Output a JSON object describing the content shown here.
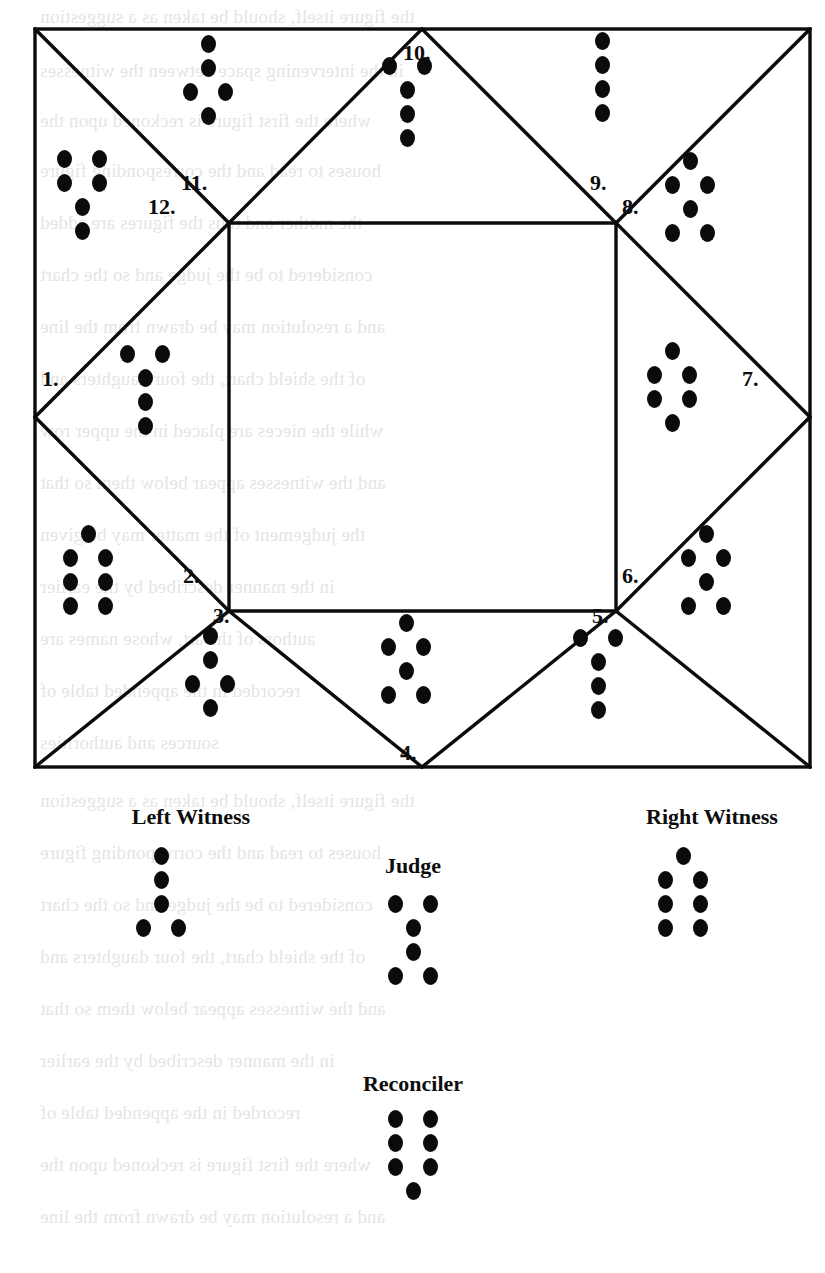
{
  "chart_data": {
    "type": "diagram",
    "row_notation": {
      "1": "single",
      "2": "double"
    },
    "shield_houses": [
      {
        "number": "1.",
        "name": "Cauda Draconis",
        "rows": [
          2,
          1,
          1,
          1
        ]
      },
      {
        "number": "2.",
        "name": "Rubeus",
        "rows": [
          1,
          2,
          2,
          2
        ]
      },
      {
        "number": "3.",
        "name": "Laetitia",
        "rows": [
          1,
          1,
          2,
          1
        ]
      },
      {
        "number": "4.",
        "name": "Amissio",
        "rows": [
          1,
          2,
          1,
          2
        ]
      },
      {
        "number": "5.",
        "name": "Cauda Draconis",
        "rows": [
          2,
          1,
          1,
          1
        ]
      },
      {
        "number": "6.",
        "name": "Amissio",
        "rows": [
          1,
          2,
          1,
          2
        ]
      },
      {
        "number": "7.",
        "name": "Conjunctio",
        "rows": [
          1,
          2,
          2,
          1
        ]
      },
      {
        "number": "8.",
        "name": "Amissio",
        "rows": [
          1,
          2,
          1,
          2
        ]
      },
      {
        "number": "9.",
        "name": "Via",
        "rows": [
          1,
          1,
          1,
          1
        ]
      },
      {
        "number": "10.",
        "name": "Cauda Draconis",
        "rows": [
          2,
          1,
          1,
          1
        ]
      },
      {
        "number": "11.",
        "name": "Laetitia",
        "rows": [
          1,
          1,
          2,
          1
        ]
      },
      {
        "number": "12.",
        "name": "Albus",
        "rows": [
          2,
          2,
          1,
          1
        ]
      }
    ],
    "roles": [
      {
        "key": "left_witness",
        "label": "Left Witness",
        "name": "Puella",
        "rows": [
          1,
          1,
          1,
          2
        ]
      },
      {
        "key": "right_witness",
        "label": "Right Witness",
        "name": "Rubeus",
        "rows": [
          1,
          2,
          2,
          2
        ]
      },
      {
        "key": "judge",
        "label": "Judge",
        "name": "Carcer",
        "rows": [
          2,
          1,
          1,
          2
        ]
      },
      {
        "key": "reconciler",
        "label": "Reconciler",
        "name": "Tristitia",
        "rows": [
          2,
          2,
          2,
          1
        ]
      }
    ]
  },
  "shield": {
    "houses": [
      {
        "number": "1.",
        "rows": [
          2,
          1,
          1,
          1
        ]
      },
      {
        "number": "2.",
        "rows": [
          1,
          2,
          2,
          2
        ]
      },
      {
        "number": "3.",
        "rows": [
          1,
          1,
          2,
          1
        ]
      },
      {
        "number": "4.",
        "rows": [
          1,
          2,
          1,
          2
        ]
      },
      {
        "number": "5.",
        "rows": [
          2,
          1,
          1,
          1
        ]
      },
      {
        "number": "6.",
        "rows": [
          1,
          2,
          1,
          2
        ]
      },
      {
        "number": "7.",
        "rows": [
          1,
          2,
          2,
          1
        ]
      },
      {
        "number": "8.",
        "rows": [
          1,
          2,
          1,
          2
        ]
      },
      {
        "number": "9.",
        "rows": [
          1,
          1,
          1,
          1
        ]
      },
      {
        "number": "10.",
        "rows": [
          2,
          1,
          1,
          1
        ]
      },
      {
        "number": "11.",
        "rows": [
          1,
          1,
          2,
          1
        ]
      },
      {
        "number": "12.",
        "rows": [
          2,
          2,
          1,
          1
        ]
      }
    ]
  },
  "roles": {
    "left_witness": {
      "label": "Left Witness",
      "rows": [
        1,
        1,
        1,
        2
      ]
    },
    "right_witness": {
      "label": "Right Witness",
      "rows": [
        1,
        2,
        2,
        2
      ]
    },
    "judge": {
      "label": "Judge",
      "rows": [
        2,
        1,
        1,
        2
      ]
    },
    "reconciler": {
      "label": "Reconciler",
      "rows": [
        2,
        2,
        2,
        1
      ]
    }
  },
  "colors": {
    "ink": "#0b0b0b",
    "paper": "#ffffff",
    "bleed": "#6a6256"
  },
  "bleed_text": [
    "the figure itself, should be taken as a suggestion",
    "in the intervening space between the witnesses",
    "where the first figure is reckoned upon the",
    "houses to read and the corresponding figure",
    "the mother and thus the figures are added",
    "considered to be the judge and so the chart",
    "and a resolution may be drawn from the line",
    "of the shield chart, the four daughters and",
    "while the nieces are placed in the upper row",
    "and the witnesses appear below them so that",
    "the judgement of the matter may be given",
    "in the manner described by the earlier",
    "authors of the art, whose names are",
    "recorded in the appended table of",
    "sources and authorities"
  ]
}
